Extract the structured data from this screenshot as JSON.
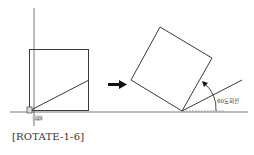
{
  "figure": {
    "caption": "[ROTATE-1-6]",
    "base_point_label": "기준점",
    "rotation_label": "60도회전",
    "rotation_angle_deg": 60,
    "colors": {
      "line": "#3a3a3a",
      "axis": "#555555",
      "arrow": "#111111",
      "base_box_fill": "#dddddd"
    }
  }
}
